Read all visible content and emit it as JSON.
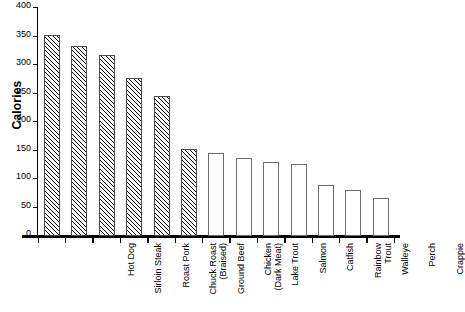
{
  "chart_data": {
    "type": "bar",
    "title": "",
    "xlabel": "",
    "ylabel": "Calories",
    "ylim": [
      0,
      400
    ],
    "yticks": [
      0,
      50,
      100,
      150,
      200,
      250,
      300,
      350,
      400
    ],
    "ytick_labels": [
      "0",
      "50",
      "100",
      "150",
      "200",
      "250",
      "300",
      "350",
      "400"
    ],
    "grid": false,
    "legend": "none",
    "categories": [
      "Hot Dog",
      "Sirloin Steak",
      "Roast Pork",
      "Chuck Roast\n(Braised)",
      "Ground Beef",
      "Chicken\n(Dark Meat)",
      "Lake Trout",
      "Salmon",
      "Catfish",
      "Rainbow\nTrout",
      "Walleye",
      "Perch",
      "Crappie"
    ],
    "values": [
      352,
      333,
      318,
      278,
      245,
      152,
      145,
      136,
      130,
      126,
      90,
      81,
      67
    ],
    "bar_styles": [
      "hatched",
      "hatched",
      "hatched",
      "hatched",
      "hatched",
      "hatched",
      "open",
      "open",
      "open",
      "open",
      "open",
      "open",
      "open"
    ],
    "colors": {
      "axis": "#000000",
      "bar_hatch_line": "#000000",
      "bar_open_border": "#6b6b6b",
      "background": "#ffffff"
    }
  }
}
